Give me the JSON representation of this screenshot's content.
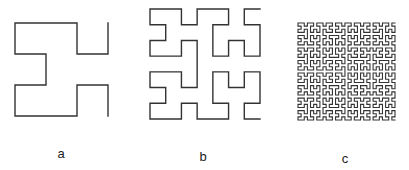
{
  "figure": {
    "stroke_color": "#333333",
    "panels": [
      {
        "id": "a",
        "label": "a",
        "order": 2,
        "grid": "4x4"
      },
      {
        "id": "b",
        "label": "b",
        "order": 3,
        "grid": "8x8"
      },
      {
        "id": "c",
        "label": "c",
        "order": 5,
        "grid": "32x32"
      }
    ]
  }
}
